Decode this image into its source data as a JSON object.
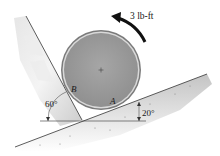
{
  "diagram": {
    "type": "statics-free-body-setup",
    "moment": {
      "label": "3 lb-ft",
      "direction": "counterclockwise"
    },
    "disk": {
      "center_mark": "+"
    },
    "contacts": [
      {
        "label": "B",
        "surface": "inclined wall"
      },
      {
        "label": "A",
        "surface": "inclined plane"
      }
    ],
    "angles": [
      {
        "label": "60°",
        "between": "wall and horizontal"
      },
      {
        "label": "20°",
        "between": "incline and horizontal"
      }
    ],
    "colors": {
      "disk_fill": "#9a9a9a",
      "disk_rim": "#6e6e6e",
      "ground_shade": "#cfcfcf",
      "wall_shade": "#d8d8d8",
      "line": "#333333"
    }
  }
}
